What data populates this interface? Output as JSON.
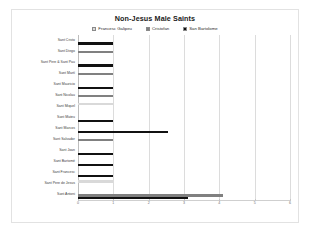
{
  "chart_data": {
    "type": "bar",
    "orientation": "horizontal",
    "title": "Non-Jesus Male Saints",
    "xlabel": "",
    "ylabel": "",
    "xlim": [
      0,
      6
    ],
    "xticks": [
      0,
      1,
      2,
      3,
      4,
      5,
      6
    ],
    "grid": true,
    "legend_position": "top",
    "categories": [
      "Sant Cristo",
      "Sant Diego",
      "Sant Pere & Sant Pau",
      "Sant Martí",
      "Sant Mauricio",
      "Sant Nicolau",
      "Sant Miquel",
      "Sant Mateu",
      "Sant Marcos",
      "Sant Salvador",
      "Sant Joan",
      "Sant Bartomé",
      "Sant Francesc",
      "Sant Pere de Jesus",
      "Sant Antoni"
    ],
    "series": [
      {
        "name": "Francesc Galipeu",
        "color": "#d9d9d9",
        "values": [
          0,
          0,
          0,
          0,
          0,
          0,
          1,
          0,
          0,
          0,
          0,
          0,
          0,
          1,
          0
        ]
      },
      {
        "name": "Cristofan",
        "color": "#808080",
        "values": [
          0,
          1,
          0,
          1,
          0,
          1,
          0,
          0,
          0,
          1,
          0,
          0,
          0,
          0,
          4.1
        ]
      },
      {
        "name": "San Bartolome",
        "color": "#111111",
        "values": [
          1,
          0,
          1,
          0,
          1,
          0,
          0,
          1,
          2.55,
          0,
          1,
          1,
          1,
          0,
          3.1
        ]
      }
    ]
  }
}
